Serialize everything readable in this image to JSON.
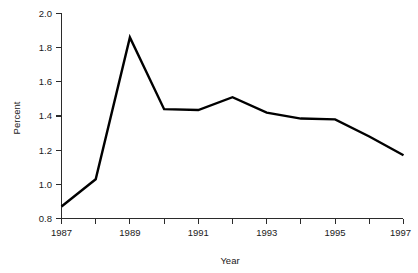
{
  "chart_data": {
    "type": "line",
    "title": "",
    "subtitle": "",
    "xlabel": "Year",
    "ylabel": "Percent",
    "x": [
      1987,
      1988,
      1989,
      1990,
      1991,
      1992,
      1993,
      1994,
      1995,
      1996,
      1997
    ],
    "values": [
      0.87,
      1.03,
      1.86,
      1.44,
      1.435,
      1.51,
      1.42,
      1.385,
      1.38,
      1.28,
      1.17
    ],
    "series": [
      {
        "name": "Percent",
        "values": [
          0.87,
          1.03,
          1.86,
          1.44,
          1.435,
          1.51,
          1.42,
          1.385,
          1.38,
          1.28,
          1.17
        ],
        "color": "#000000"
      }
    ],
    "xlim": [
      1987,
      1997
    ],
    "ylim": [
      0.8,
      2.0
    ],
    "x_tick_values": [
      1987,
      1988,
      1989,
      1990,
      1991,
      1992,
      1993,
      1994,
      1995,
      1996,
      1997
    ],
    "x_tick_labels": [
      "1987",
      "",
      "1989",
      "",
      "1991",
      "",
      "1993",
      "",
      "1995",
      "",
      "1997"
    ],
    "y_ticks": [
      0.8,
      1.0,
      1.2,
      1.4,
      1.6,
      1.8,
      2.0
    ],
    "y_tick_labels": [
      "0.8",
      "1.0",
      "1.2",
      "1.4",
      "1.6",
      "1.8",
      "2.0"
    ],
    "grid": false,
    "legend": false,
    "legend_position": "none",
    "line_color": "#000000",
    "background_color": "#ffffff",
    "axis_color": "#2b2b2b"
  },
  "axes": {
    "y_title": "Percent",
    "x_title": "Year",
    "y_labels": [
      "2.0",
      "1.8",
      "1.6",
      "1.4",
      "1.2",
      "1.0",
      "0.8"
    ],
    "x_labels": [
      "1987",
      "1989",
      "1991",
      "1993",
      "1995",
      "1997"
    ]
  }
}
